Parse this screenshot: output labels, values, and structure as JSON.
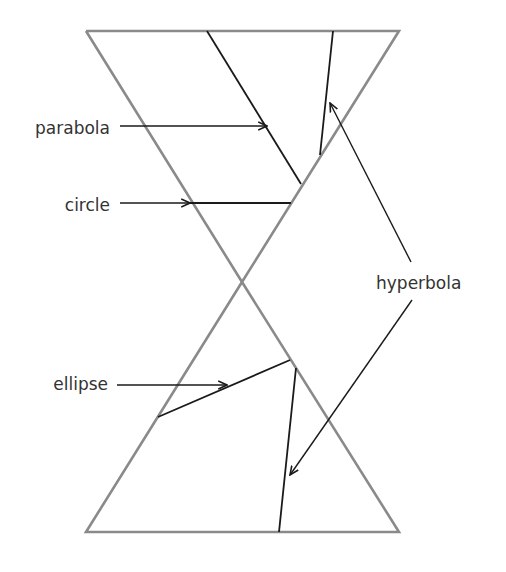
{
  "diagram": {
    "labels": {
      "parabola": "parabola",
      "circle": "circle",
      "hyperbola": "hyperbola",
      "ellipse": "ellipse"
    },
    "colors": {
      "cone": "#8a8a8a",
      "sections": "#1a1a1a",
      "text": "#333333",
      "background": "#ffffff"
    }
  }
}
